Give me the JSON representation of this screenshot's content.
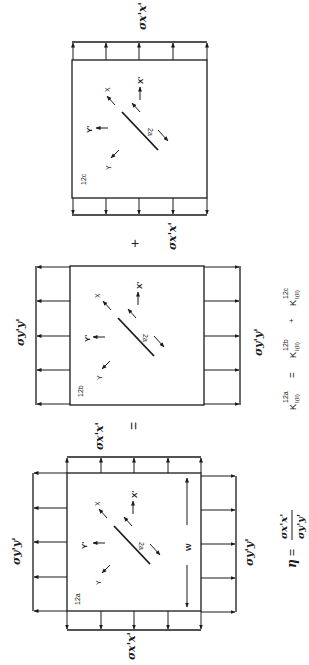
{
  "figure": {
    "orientation": "rotated-90-ccw",
    "line_color": "#1a1a1a",
    "background": "#ffffff"
  },
  "panels": [
    {
      "id": "12a",
      "label": "12a",
      "coord_labels": {
        "x": "X",
        "y": "Y",
        "x_prime": "X'",
        "y_prime": "Y'"
      },
      "crack_label": "2a",
      "width_label": "W",
      "stress_labels": {
        "top": "σx'x'",
        "bottom": "σx'x'",
        "left": "σy'y'",
        "right": "σy'y'"
      }
    },
    {
      "id": "12b",
      "label": "12b",
      "coord_labels": {
        "x": "X",
        "y": "Y",
        "x_prime": "X'",
        "y_prime": "Y'"
      },
      "crack_label": "2a",
      "stress_labels": {
        "left": "σy'y'",
        "right": "σy'y'"
      }
    },
    {
      "id": "12c",
      "label": "12c",
      "coord_labels": {
        "x": "X",
        "y": "Y",
        "x_prime": "X'",
        "y_prime": "Y'"
      },
      "crack_label": "2a",
      "stress_labels": {
        "top": "σx'x'",
        "bottom": "σx'x'"
      }
    }
  ],
  "operators": {
    "equals": "=",
    "plus": "+"
  },
  "equations": {
    "superposition": {
      "lhs": {
        "symbol": "K",
        "sup": "12a",
        "sub": "I(II)"
      },
      "eq": "=",
      "term1": {
        "symbol": "K",
        "sup": "12b",
        "sub": "I(II)"
      },
      "op": "+",
      "term2": {
        "symbol": "K",
        "sup": "12c",
        "sub": "I(II)"
      }
    },
    "biaxial_ratio": {
      "symbol": "η",
      "eq": "=",
      "numerator": "σx'x'",
      "denominator": "σy'y'"
    }
  }
}
